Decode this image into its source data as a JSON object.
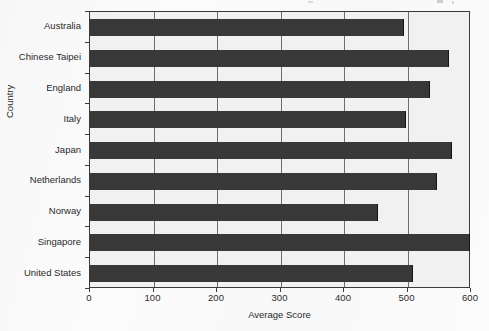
{
  "chart_data": {
    "type": "bar",
    "orientation": "horizontal",
    "title": "",
    "xlabel": "Average Score",
    "ylabel": "Country",
    "categories": [
      "Australia",
      "Chinese Taipei",
      "England",
      "Italy",
      "Japan",
      "Netherlands",
      "Norway",
      "Singapore",
      "United States"
    ],
    "values": [
      494,
      566,
      535,
      497,
      570,
      547,
      454,
      598,
      508
    ],
    "xlim": [
      0,
      600
    ],
    "xticks": [
      0,
      100,
      200,
      300,
      400,
      500,
      600
    ],
    "xtick_labels": [
      "0",
      "100",
      "200",
      "300",
      "400",
      "500",
      "600"
    ],
    "grid": "vertical-only",
    "legend": "none",
    "bar_color": "#383838",
    "plot_background": "#f1f1f1",
    "axis_color": "#3b3b3b",
    "gridline_color": "#6e6e6e"
  }
}
